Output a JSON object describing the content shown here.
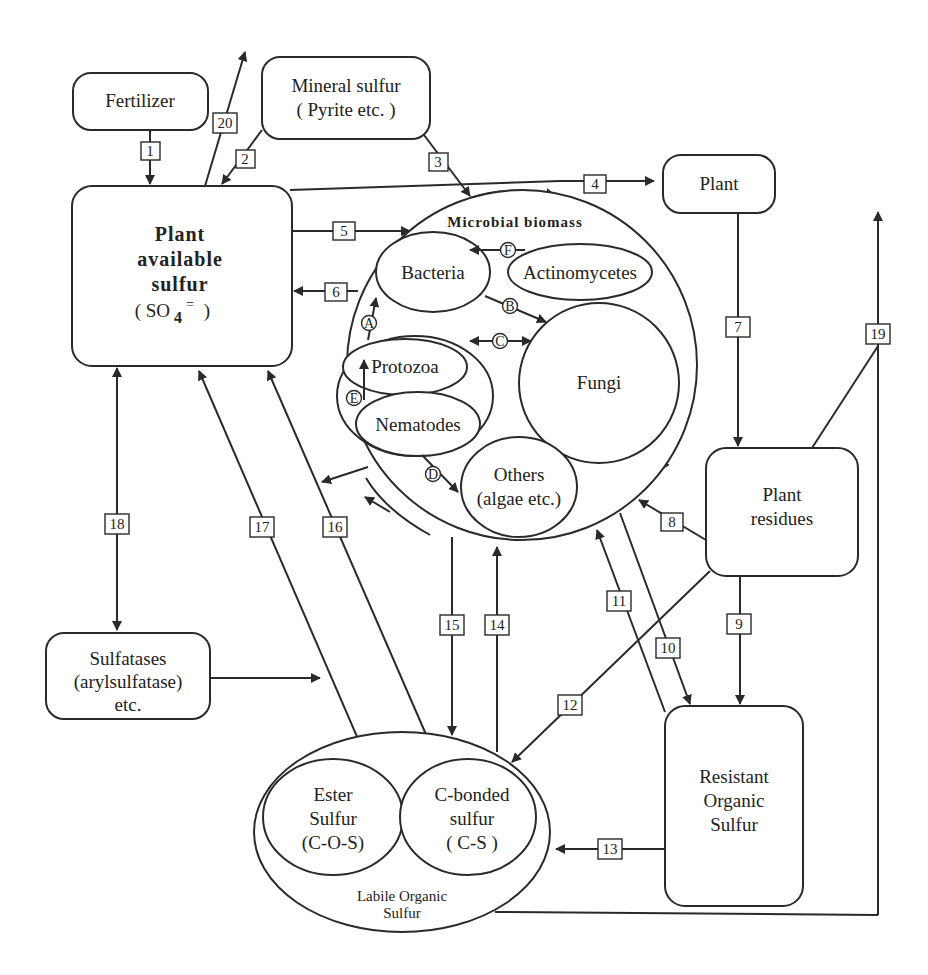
{
  "diagram": {
    "type": "sulfur cycle flow diagram",
    "nodes": {
      "fertilizer": "Fertilizer",
      "mineral_sulfur": [
        "Mineral sulfur",
        "( Pyrite etc. )"
      ],
      "plant": "Plant",
      "plant_available": [
        "Plant",
        "available",
        "sulfur",
        "( SO",
        "4",
        "=",
        " )"
      ],
      "microbial_biomass": "Microbial  biomass",
      "bacteria": "Bacteria",
      "actinomycetes": "Actinomycetes",
      "protozoa": "Protozoa",
      "nematodes": "Nematodes",
      "fungi": "Fungi",
      "others": [
        "Others",
        "(algae etc.)"
      ],
      "plant_residues": [
        "Plant",
        "residues"
      ],
      "sulfatases": [
        "Sulfatases",
        "(arylsulfatase)",
        "etc."
      ],
      "resistant": [
        "Resistant",
        "Organic",
        "Sulfur"
      ],
      "ester": [
        "Ester",
        "Sulfur",
        "(C-O-S)"
      ],
      "cbonded": [
        "C-bonded",
        "sulfur",
        "( C-S )"
      ],
      "labile": [
        "Labile Organic",
        "Sulfur"
      ]
    },
    "flow_labels": [
      "1",
      "2",
      "3",
      "4",
      "5",
      "6",
      "7",
      "8",
      "9",
      "10",
      "11",
      "12",
      "13",
      "14",
      "15",
      "16",
      "17",
      "18",
      "19",
      "20"
    ],
    "internal_labels": [
      "A",
      "B",
      "C",
      "D",
      "E",
      "F"
    ]
  }
}
